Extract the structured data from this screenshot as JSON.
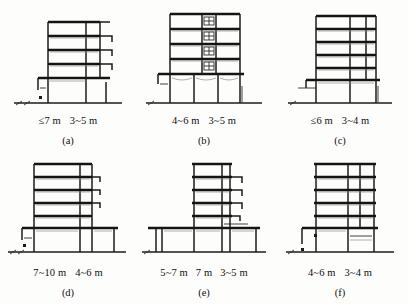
{
  "figure": {
    "type": "technical-diagram",
    "panel_count": 6,
    "unit_symbol": "m",
    "range_symbol": "~",
    "max_symbol": "≤",
    "ink_color": "#1b1b1b",
    "background_color": "#fdfdfb"
  },
  "panels": [
    {
      "caption": "(a)",
      "stories_upper": 4,
      "podium_stories": 1,
      "dimensions": [
        {
          "value": "≤7 m"
        },
        {
          "value": "3~5 m"
        }
      ]
    },
    {
      "caption": "(b)",
      "stories_upper": 4,
      "podium_stories": 1,
      "dimensions": [
        {
          "value": "4~6 m"
        },
        {
          "value": "3~5 m"
        }
      ]
    },
    {
      "caption": "(c)",
      "stories_upper": 5,
      "podium_stories": 1,
      "dimensions": [
        {
          "value": "≤6 m"
        },
        {
          "value": "3~4 m"
        }
      ]
    },
    {
      "caption": "(d)",
      "stories_upper": 5,
      "podium_stories": 1,
      "dimensions": [
        {
          "value": "7~10 m"
        },
        {
          "value": "4~6 m"
        }
      ]
    },
    {
      "caption": "(e)",
      "stories_upper": 5,
      "podium_stories": 1,
      "dimensions": [
        {
          "value": "5~7 m"
        },
        {
          "value": "7 m"
        },
        {
          "value": "3~5 m"
        }
      ]
    },
    {
      "caption": "(f)",
      "stories_upper": 5,
      "podium_stories": 1,
      "dimensions": [
        {
          "value": "4~6 m"
        },
        {
          "value": "3~4 m"
        }
      ]
    }
  ]
}
